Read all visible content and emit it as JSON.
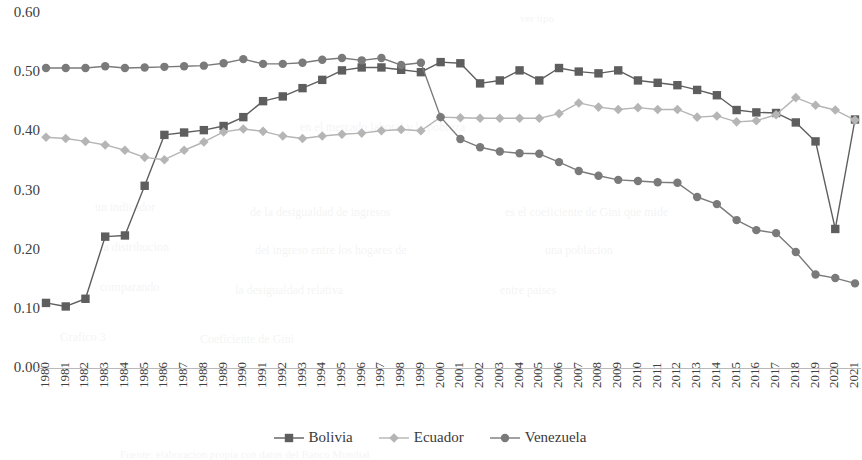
{
  "chart_data": {
    "type": "line",
    "title": "",
    "subtitle": "",
    "xlabel": "",
    "ylabel": "",
    "grid": false,
    "legend_position": "bottom",
    "ylim": [
      0.0,
      0.6
    ],
    "ytick_labels": [
      "0.00",
      "0.10",
      "0.20",
      "0.30",
      "0.40",
      "0.50",
      "0.60"
    ],
    "ytick_values": [
      0.0,
      0.1,
      0.2,
      0.3,
      0.4,
      0.5,
      0.6
    ],
    "categories": [
      "1980",
      "1981",
      "1982",
      "1983",
      "1984",
      "1985",
      "1986",
      "1987",
      "1988",
      "1989",
      "1990",
      "1991",
      "1992",
      "1993",
      "1994",
      "1995",
      "1996",
      "1997",
      "1998",
      "1999",
      "2000",
      "2001",
      "2002",
      "2003",
      "2004",
      "2005",
      "2006",
      "2007",
      "2008",
      "2009",
      "2010",
      "2011",
      "2012",
      "2013",
      "2014",
      "2015",
      "2016",
      "2017",
      "2018",
      "2019",
      "2020",
      "2021"
    ],
    "series": [
      {
        "name": "Bolivia",
        "color": "#5e5e5e",
        "marker": "square",
        "values": [
          0.11,
          0.104,
          0.117,
          0.222,
          0.224,
          0.308,
          0.394,
          0.398,
          0.402,
          0.409,
          0.424,
          0.451,
          0.459,
          0.473,
          0.487,
          0.503,
          0.508,
          0.508,
          0.504,
          0.5,
          0.517,
          0.515,
          0.481,
          0.486,
          0.503,
          0.486,
          0.507,
          0.501,
          0.498,
          0.503,
          0.486,
          0.482,
          0.478,
          0.47,
          0.461,
          0.436,
          0.432,
          0.431,
          0.415,
          0.383,
          0.235,
          0.42
        ]
      },
      {
        "name": "Ecuador",
        "color": "#b5b5b5",
        "marker": "diamond",
        "values": [
          0.39,
          0.388,
          0.383,
          0.377,
          0.368,
          0.356,
          0.352,
          0.368,
          0.382,
          0.399,
          0.404,
          0.4,
          0.392,
          0.388,
          0.392,
          0.395,
          0.397,
          0.401,
          0.403,
          0.401,
          0.424,
          0.423,
          0.422,
          0.422,
          0.422,
          0.422,
          0.43,
          0.448,
          0.441,
          0.437,
          0.44,
          0.437,
          0.437,
          0.424,
          0.426,
          0.416,
          0.418,
          0.428,
          0.457,
          0.444,
          0.436,
          0.419
        ]
      },
      {
        "name": "Venezuela",
        "color": "#7a7a7a",
        "marker": "circle",
        "values": [
          0.507,
          0.507,
          0.507,
          0.51,
          0.507,
          0.508,
          0.509,
          0.51,
          0.511,
          0.515,
          0.522,
          0.514,
          0.514,
          0.516,
          0.521,
          0.524,
          0.52,
          0.524,
          0.512,
          0.516,
          0.424,
          0.387,
          0.373,
          0.366,
          0.363,
          0.362,
          0.348,
          0.333,
          0.325,
          0.318,
          0.316,
          0.314,
          0.313,
          0.289,
          0.277,
          0.25,
          0.233,
          0.228,
          0.196,
          0.158,
          0.152,
          0.143
        ]
      }
    ]
  },
  "legend": {
    "items": [
      {
        "label": "Bolivia",
        "color": "#5e5e5e",
        "marker": "square"
      },
      {
        "label": "Ecuador",
        "color": "#b5b5b5",
        "marker": "diamond"
      },
      {
        "label": "Venezuela",
        "color": "#7a7a7a",
        "marker": "circle"
      }
    ]
  },
  "bleed_text": [
    {
      "text": "ver tipo",
      "x": 520,
      "y": 12,
      "size": 11
    },
    {
      "text": "en el mercado laboral y la pobreza",
      "x": 300,
      "y": 120,
      "size": 12
    },
    {
      "text": "un indicador",
      "x": 95,
      "y": 200,
      "size": 12
    },
    {
      "text": "de la desigualdad de ingresos",
      "x": 250,
      "y": 205,
      "size": 12
    },
    {
      "text": "es el coeficiente de Gini que mide",
      "x": 505,
      "y": 205,
      "size": 12
    },
    {
      "text": "la distribucion",
      "x": 100,
      "y": 240,
      "size": 12
    },
    {
      "text": "del ingreso entre los hogares de",
      "x": 255,
      "y": 243,
      "size": 12
    },
    {
      "text": "una poblacion",
      "x": 545,
      "y": 243,
      "size": 12
    },
    {
      "text": "comparando",
      "x": 100,
      "y": 280,
      "size": 12
    },
    {
      "text": "la desigualdad relativa",
      "x": 235,
      "y": 283,
      "size": 12
    },
    {
      "text": "entre paises",
      "x": 500,
      "y": 283,
      "size": 12
    },
    {
      "text": "Grafico 3",
      "x": 60,
      "y": 330,
      "size": 12
    },
    {
      "text": "Coeficiente de Gini",
      "x": 200,
      "y": 332,
      "size": 12
    },
    {
      "text": "Fuente: elaboracion propia con datos del Banco Mundial",
      "x": 120,
      "y": 448,
      "size": 11
    }
  ]
}
